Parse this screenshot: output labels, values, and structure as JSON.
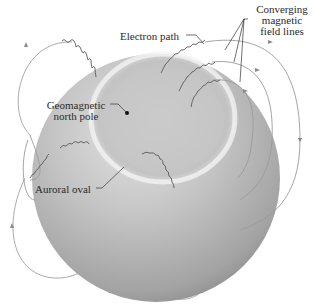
{
  "diagram": {
    "type": "scientific-illustration",
    "colors": {
      "sphere_light": "#e6e6e6",
      "sphere_mid": "#b8b8b8",
      "sphere_dark": "#8c8c8c",
      "field_line": "#9a9a9a",
      "electron_path": "#555555",
      "label_text": "#2a2a2a",
      "pole_dot": "#111111"
    },
    "labels": {
      "electron_path": "Electron path",
      "converging_line1": "Converging",
      "converging_line2": "magnetic",
      "converging_line3": "field lines",
      "geomagnetic_line1": "Geomagnetic",
      "geomagnetic_line2": "north pole",
      "auroral_oval": "Auroral oval"
    }
  }
}
